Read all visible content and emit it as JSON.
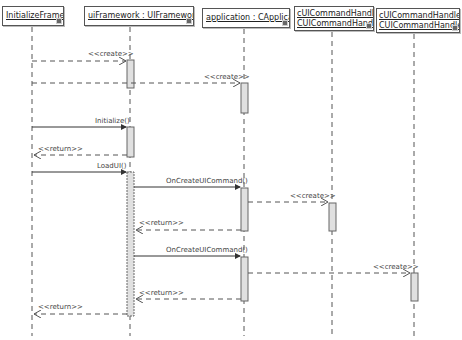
{
  "diagram": {
    "type": "UML sequence diagram",
    "lifelines": [
      {
        "id": "initFw",
        "name": "InitializeFramework",
        "line1": "InitializeFramework",
        "line2": "",
        "x": 32
      },
      {
        "id": "uiFw",
        "name": "uiFramework : UIFramework",
        "line1": "uiFramework : UIFramework",
        "line2": "",
        "x": 130
      },
      {
        "id": "app",
        "name": "application : CApplication",
        "line1": "application : CApplication",
        "line2": "",
        "x": 244
      },
      {
        "id": "h0",
        "name": "cUICommandHandler: CUICommandHandler",
        "line1": "cUICommandHandler:",
        "line2": "CUICommandHandler",
        "x": 332
      },
      {
        "id": "h1",
        "name": "cUICommandHandler1: CUICommandHandler",
        "line1": "cUICommandHandler1:",
        "line2": "CUICommandHandler",
        "x": 414
      }
    ],
    "messages": [
      {
        "label": "<<create>>",
        "from": "initFw",
        "to": "uiFw",
        "kind": "create",
        "y": 61
      },
      {
        "label": "<<create>>",
        "from": "initFw",
        "to": "app",
        "kind": "create",
        "y": 83
      },
      {
        "label": "Initialize()",
        "from": "initFw",
        "to": "uiFw",
        "kind": "call",
        "y": 127
      },
      {
        "label": "<<return>>",
        "from": "uiFw",
        "to": "initFw",
        "kind": "return",
        "y": 155
      },
      {
        "label": "LoadUI()",
        "from": "initFw",
        "to": "uiFw",
        "kind": "call",
        "y": 172
      },
      {
        "label": "OnCreateUICommand()",
        "from": "uiFw",
        "to": "app",
        "kind": "call",
        "y": 187
      },
      {
        "label": "<<create>>",
        "from": "app",
        "to": "h0",
        "kind": "create",
        "y": 202
      },
      {
        "label": "<<return>>",
        "from": "app",
        "to": "uiFw",
        "kind": "return",
        "y": 230
      },
      {
        "label": "OnCreateUICommand()",
        "from": "uiFw",
        "to": "app",
        "kind": "call",
        "y": 256
      },
      {
        "label": "<<create>>",
        "from": "app",
        "to": "h1",
        "kind": "create",
        "y": 273
      },
      {
        "label": "<<return>>",
        "from": "app",
        "to": "uiFw",
        "kind": "return",
        "y": 299
      },
      {
        "label": "<<return>>",
        "from": "uiFw",
        "to": "initFw",
        "kind": "return",
        "y": 314
      }
    ],
    "colors": {
      "line": "#555555",
      "activation_fill": "#e0e0e0",
      "activation_border": "#666666",
      "text": "#333333"
    }
  }
}
